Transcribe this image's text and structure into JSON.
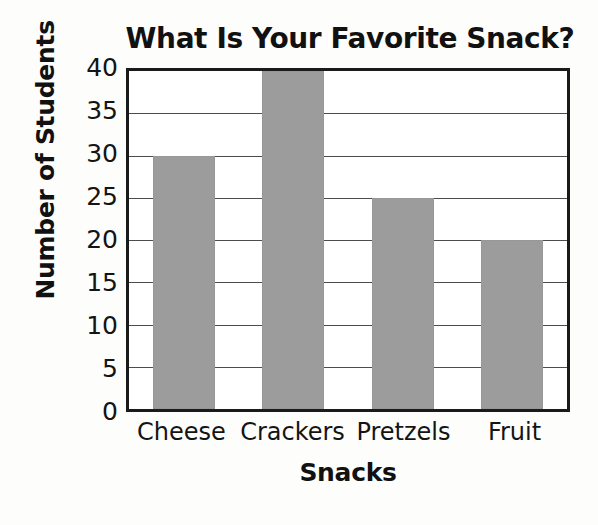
{
  "chart_data": {
    "type": "bar",
    "title": "What Is Your Favorite Snack?",
    "xlabel": "Snacks",
    "ylabel": "Number of Students",
    "categories": [
      "Cheese",
      "Crackers",
      "Pretzels",
      "Fruit"
    ],
    "values": [
      30,
      40,
      25,
      20
    ],
    "ylim": [
      0,
      40
    ],
    "ytick_step": 5,
    "yticks": [
      40,
      35,
      30,
      25,
      20,
      15,
      10,
      5,
      0
    ],
    "grid": true,
    "grid_axis": "y",
    "legend": false,
    "legend_position": "none",
    "bar_color": "#9c9c9c",
    "axis_color": "#1a1a1a",
    "grid_color": "#4c4c4c",
    "text_color": "#111111",
    "background_color": "#ffffff"
  }
}
